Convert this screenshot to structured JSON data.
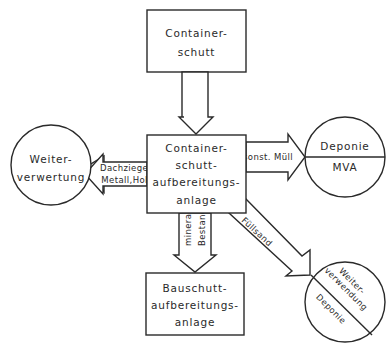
{
  "diagram": {
    "nodes": {
      "source": {
        "shape": "rectangle",
        "lines": [
          "Container-",
          "schutt"
        ]
      },
      "plant": {
        "shape": "rectangle",
        "lines": [
          "Container-",
          "schutt-",
          "aufbereitungs-",
          "anlage"
        ]
      },
      "reuse_left": {
        "shape": "circle",
        "lines": [
          "Weiter-",
          "verwertung"
        ]
      },
      "landfill_right": {
        "shape": "circle-split-horizontal",
        "top": "Deponie",
        "bottom": "MVA"
      },
      "rubble_plant": {
        "shape": "rectangle",
        "lines": [
          "Bauschutt-",
          "aufbereitungs-",
          "anlage"
        ]
      },
      "reuse_diag": {
        "shape": "circle-split-diagonal",
        "top_lines": [
          "Weiter-",
          "verwendung"
        ],
        "bottom": "Deponie"
      }
    },
    "edges": {
      "source_to_plant": {
        "from": "source",
        "to": "plant",
        "label": ""
      },
      "plant_to_reuse_left": {
        "from": "plant",
        "to": "reuse_left",
        "lines": [
          "Dachziegel,",
          "Metall,Holz"
        ]
      },
      "plant_to_landfill": {
        "from": "plant",
        "to": "landfill_right",
        "label": "sonst. Müll"
      },
      "plant_to_rubble": {
        "from": "plant",
        "to": "rubble_plant",
        "lines": [
          "mineralische",
          "Bestandteil"
        ]
      },
      "plant_to_reuse_diag": {
        "from": "plant",
        "to": "reuse_diag",
        "label": "Füllsand"
      }
    },
    "colors": {
      "stroke": "#2a2a2a",
      "background": "#ffffff"
    }
  }
}
